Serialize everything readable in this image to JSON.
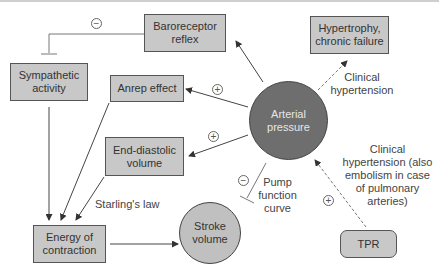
{
  "nodes": {
    "baroreceptor": "Baroreceptor reflex",
    "hypertrophy": "Hypertrophy, chronic failure",
    "sympathetic": "Sympathetic activity",
    "anrep": "Anrep effect",
    "arterial": "Arterial pressure",
    "edv": "End-diastolic volume",
    "energy": "Energy of contraction",
    "stroke": "Stroke volume",
    "tpr": "TPR"
  },
  "labels": {
    "clinical_htn_top": "Clinical hypertension",
    "starling": "Starling's law",
    "pump_curve": "Pump function curve",
    "clinical_htn_right": "Clinical hypertension (also embolism in case of pulmonary arteries)"
  },
  "signs": {
    "baro_inhibit": "−",
    "anrep_plus": "+",
    "edv_plus": "+",
    "pump_minus": "−",
    "tpr_plus": "+"
  },
  "colors": {
    "box_fill": "#c8c8c8",
    "arterial_fill": "#6e6e6e",
    "stroke_fill": "#c0c0c0",
    "line": "#555555"
  }
}
